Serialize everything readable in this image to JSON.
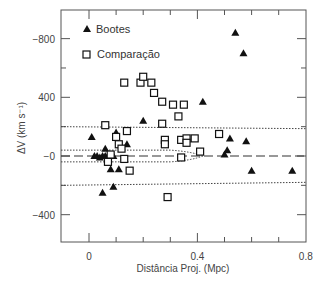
{
  "chart_data": {
    "type": "scatter",
    "title": "",
    "xlabel": "Distância Proj. (Mpc)",
    "ylabel": "ΔV (km s⁻¹)",
    "xlim": [
      -0.1,
      0.8
    ],
    "ylim": [
      -600,
      1000
    ],
    "x_ticks": [
      {
        "value": 0,
        "label": "0"
      },
      {
        "value": 0.4,
        "label": "0.4"
      },
      {
        "value": 0.8,
        "label": "0.8"
      }
    ],
    "x_minor_ticks": [
      0.1,
      0.2,
      0.3,
      0.5,
      0.6,
      0.7
    ],
    "y_ticks": [
      {
        "value": 800,
        "label": "−800"
      },
      {
        "value": 400,
        "label": "400"
      },
      {
        "value": 0,
        "label": "−0"
      },
      {
        "value": -400,
        "label": "−400"
      }
    ],
    "y_minor_ticks": [
      600,
      200,
      -200
    ],
    "grid": false,
    "legend_position": "upper-left",
    "legend": [
      {
        "name": "Bootes",
        "marker": "filled-triangle"
      },
      {
        "name": "Comparação",
        "marker": "open-square"
      }
    ],
    "series": [
      {
        "name": "Bootes",
        "marker": "filled-triangle",
        "points": [
          [
            0.01,
            130
          ],
          [
            0.02,
            0
          ],
          [
            0.03,
            0
          ],
          [
            0.04,
            -10
          ],
          [
            0.05,
            -250
          ],
          [
            0.05,
            0
          ],
          [
            0.06,
            50
          ],
          [
            0.06,
            0
          ],
          [
            0.07,
            0
          ],
          [
            0.08,
            -90
          ],
          [
            0.09,
            0
          ],
          [
            0.09,
            -210
          ],
          [
            0.1,
            160
          ],
          [
            0.11,
            -90
          ],
          [
            0.14,
            80
          ],
          [
            0.2,
            240
          ],
          [
            0.42,
            370
          ],
          [
            0.54,
            840
          ],
          [
            0.57,
            700
          ],
          [
            0.5,
            10
          ],
          [
            0.51,
            40
          ],
          [
            0.52,
            120
          ],
          [
            0.58,
            100
          ],
          [
            0.6,
            -100
          ],
          [
            0.75,
            -100
          ]
        ]
      },
      {
        "name": "Comparação",
        "marker": "open-square",
        "points": [
          [
            0.06,
            210
          ],
          [
            0.07,
            -40
          ],
          [
            0.08,
            10
          ],
          [
            0.1,
            130
          ],
          [
            0.11,
            80
          ],
          [
            0.12,
            50
          ],
          [
            0.13,
            -20
          ],
          [
            0.14,
            170
          ],
          [
            0.15,
            -100
          ],
          [
            0.13,
            500
          ],
          [
            0.19,
            500
          ],
          [
            0.2,
            540
          ],
          [
            0.23,
            500
          ],
          [
            0.24,
            430
          ],
          [
            0.27,
            370
          ],
          [
            0.27,
            220
          ],
          [
            0.28,
            110
          ],
          [
            0.28,
            80
          ],
          [
            0.29,
            -280
          ],
          [
            0.31,
            350
          ],
          [
            0.33,
            270
          ],
          [
            0.34,
            110
          ],
          [
            0.35,
            350
          ],
          [
            0.36,
            120
          ],
          [
            0.36,
            90
          ],
          [
            0.34,
            -10
          ],
          [
            0.39,
            120
          ],
          [
            0.48,
            150
          ],
          [
            0.41,
            30
          ]
        ]
      }
    ],
    "reference_lines": [
      {
        "style": "dashed",
        "description": "mean ΔV = 0 line",
        "y": 0
      },
      {
        "style": "dotted",
        "description": "outer envelope",
        "y_upper": 200,
        "y_lower": -200
      },
      {
        "style": "dotted",
        "description": "inner converging envelope",
        "y_upper_start": 40,
        "y_lower_start": -40,
        "converge_x": 0.42
      }
    ]
  },
  "legend": {
    "bootes_label": "Bootes",
    "comparacao_label": "Comparação"
  },
  "axes": {
    "xlabel": "Distância Proj. (Mpc)",
    "ylabel": "ΔV (km s⁻¹)"
  }
}
